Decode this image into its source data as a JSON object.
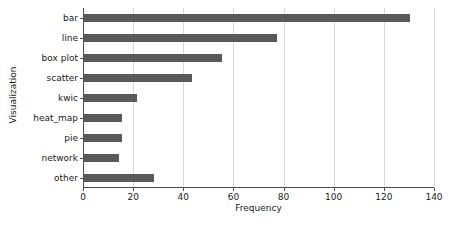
{
  "chart_data": {
    "type": "bar",
    "orientation": "horizontal",
    "title": "",
    "xlabel": "Frequency",
    "ylabel": "Visualization",
    "categories": [
      "bar",
      "line",
      "box plot",
      "scatter",
      "kwic",
      "heat_map",
      "pie",
      "network",
      "other"
    ],
    "values": [
      130,
      77,
      55,
      43,
      21,
      15,
      15,
      14,
      28
    ],
    "xlim": [
      0,
      140
    ],
    "xticks": [
      0,
      20,
      40,
      60,
      80,
      100,
      120,
      140
    ],
    "xticklabels": [
      "0",
      "20",
      "40",
      "60",
      "80",
      "100",
      "120",
      "140"
    ],
    "grid": "vertical",
    "legend": null,
    "bar_color": "#595959",
    "grid_color": "#d9d9d9",
    "axis_color": "#4d4d4d",
    "background": "#ffffff"
  }
}
